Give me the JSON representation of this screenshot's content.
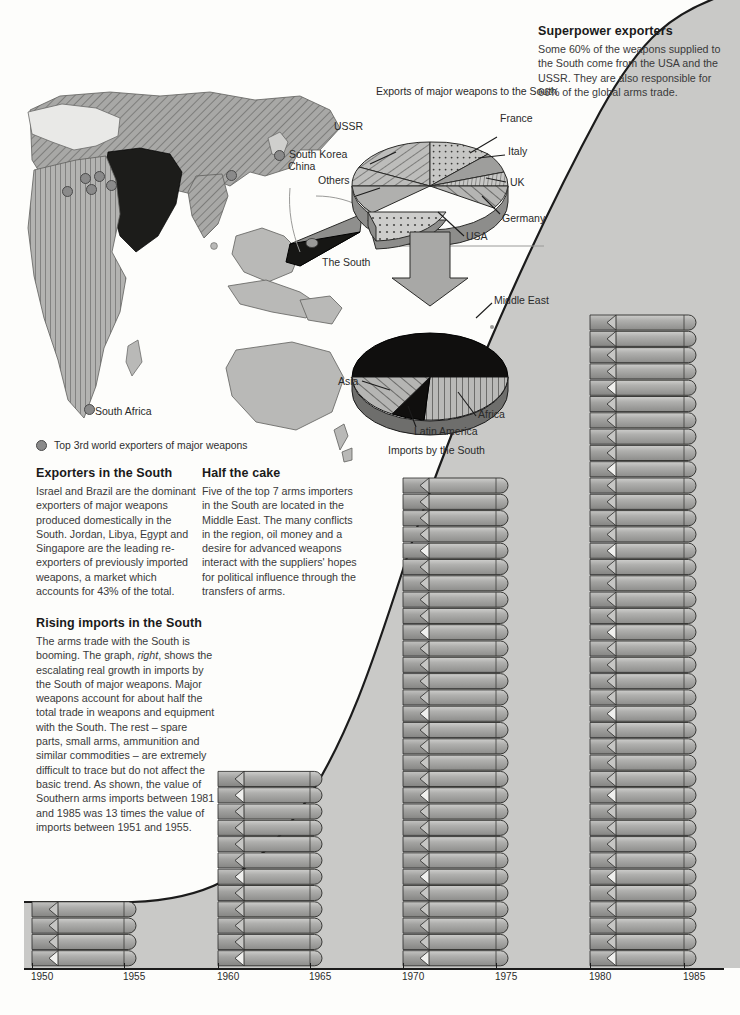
{
  "meta": {
    "page_bg": "#fdfdfb",
    "ink": "#231f20",
    "area_fill": "#c9c9c7",
    "missile_light": "#b4b4b2",
    "missile_dark": "#8f8f8d"
  },
  "texts": {
    "superpower": {
      "heading": "Superpower exporters",
      "body": "Some 60% of the weapons supplied to the South come from the USA and the USSR. They are also responsible for 66% of the global arms trade."
    },
    "exporters_south": {
      "heading": "Exporters in the South",
      "body": "Israel and Brazil are the dominant exporters of major weapons produced domestically in the South. Jordan, Libya, Egypt and Singapore are the leading re-exporters of previously imported weapons, a market which accounts for 43% of the total."
    },
    "half_the_cake": {
      "heading": "Half the cake",
      "body": "Five of the top 7 arms importers in the South are located in the Middle East. The many conflicts in the region, oil money and a desire for advanced weapons interact with the suppliers' hopes for political influence through the transfers of arms."
    },
    "rising_imports": {
      "heading": "Rising imports in the South",
      "body_1": "The arms trade with the South is booming. The graph, ",
      "body_em": "right",
      "body_2": ", shows the escalating real growth in imports by the South of major weapons. Major weapons account for about half the total trade in weapons and equipment with the South. The rest – spare parts, small arms, ammunition and similar commodities – are extremely difficult to trace but do not affect the basic trend.  As shown, the value of Southern arms imports between 1981 and 1985 was 13 times the value of imports between 1951 and 1955."
    }
  },
  "legend": {
    "label": "Top 3rd world exporters of major weapons",
    "marker_color": "#8a8a8a"
  },
  "map": {
    "labels": [
      {
        "text": "China",
        "x": 288,
        "y": 166
      },
      {
        "text": "South Korea",
        "x": 289,
        "y": 154
      },
      {
        "text": "South Africa",
        "x": 95,
        "y": 411
      }
    ],
    "dots": [
      {
        "x": 86,
        "y": 179
      },
      {
        "x": 100,
        "y": 177
      },
      {
        "x": 112,
        "y": 175
      },
      {
        "x": 92,
        "y": 190
      },
      {
        "x": 68,
        "y": 192
      },
      {
        "x": 82,
        "y": 407
      },
      {
        "x": 274,
        "y": 157
      },
      {
        "x": 232,
        "y": 172
      }
    ]
  },
  "chart_data": [
    {
      "type": "pie",
      "id": "exports-pie",
      "title": "Exports of major weapons to the South",
      "note": "exploded 3-D pie; USA slice pulled out",
      "labels": [
        "USSR",
        "France",
        "Italy",
        "UK",
        "Germany",
        "USA",
        "Others"
      ],
      "values": [
        32,
        13,
        4,
        6,
        5,
        28,
        12
      ],
      "unit": "percent of exports",
      "exploded_slice": "USA"
    },
    {
      "type": "pie",
      "id": "imports-pie",
      "title": "Imports by the South",
      "note": "3-D pie, Middle East dominant",
      "labels": [
        "Middle East",
        "Africa",
        "Latin America",
        "Asia"
      ],
      "values": [
        46,
        21,
        9,
        24
      ],
      "unit": "percent of imports"
    },
    {
      "type": "bar",
      "id": "imports-trend",
      "title": "Rising imports in the South",
      "xlabel": "",
      "ylabel": "Value of major weapon imports by the South",
      "note": "Each bar is a stack of missile icons; bar width spans a 5-year period",
      "categories": [
        "1950",
        "1955",
        "1960",
        "1965",
        "1970",
        "1975",
        "1980",
        "1985"
      ],
      "periods": [
        {
          "label": "1951-1955",
          "missiles": 4,
          "value": 1
        },
        {
          "label": "1961-1965",
          "missiles": 12,
          "value": 3
        },
        {
          "label": "1971-1975",
          "missiles": 30,
          "value": 7.5
        },
        {
          "label": "1981-1985",
          "missiles": 40,
          "value": 13
        }
      ],
      "values": [
        0,
        1,
        0,
        3,
        0,
        7.5,
        0,
        13
      ],
      "xlim": [
        1950,
        1985
      ],
      "grid": false,
      "legend": "none"
    }
  ],
  "pie_exports": {
    "title": "Exports of major weapons to the South",
    "labels": {
      "ussr": "USSR",
      "others": "Others",
      "france": "France",
      "italy": "Italy",
      "uk": "UK",
      "germany": "Germany",
      "usa": "USA"
    }
  },
  "pie_imports": {
    "title": "Imports by the South",
    "labels": {
      "middle_east": "Middle East",
      "asia": "Asia",
      "latin_america": "Latin America",
      "africa": "Africa"
    }
  },
  "the_south_label": "The South",
  "axis": {
    "years": [
      "1950",
      "1955",
      "1960",
      "1965",
      "1970",
      "1975",
      "1980",
      "1985"
    ],
    "x_positions": [
      32,
      124,
      218,
      310,
      403,
      496,
      590,
      684
    ]
  }
}
